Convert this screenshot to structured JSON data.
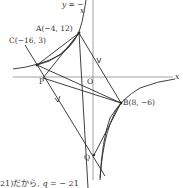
{
  "diagram": {
    "curve_label": "y = −",
    "curve_label_fraction_den": "x",
    "axis_x_label": "x",
    "origin_label": "O",
    "points": {
      "A": {
        "label": "A(−4, 12)"
      },
      "C": {
        "label": "C(−16, 3)"
      },
      "B": {
        "label": "B(8, −6)"
      },
      "P": {
        "label": "P"
      },
      "Q": {
        "label": "Q"
      }
    }
  },
  "caption": {
    "prefix": "21)だから,",
    "var": "q",
    "suffix": "= − 21"
  },
  "colors": {
    "line": "#2a2a2a",
    "axis": "#888888",
    "text": "#333333"
  }
}
